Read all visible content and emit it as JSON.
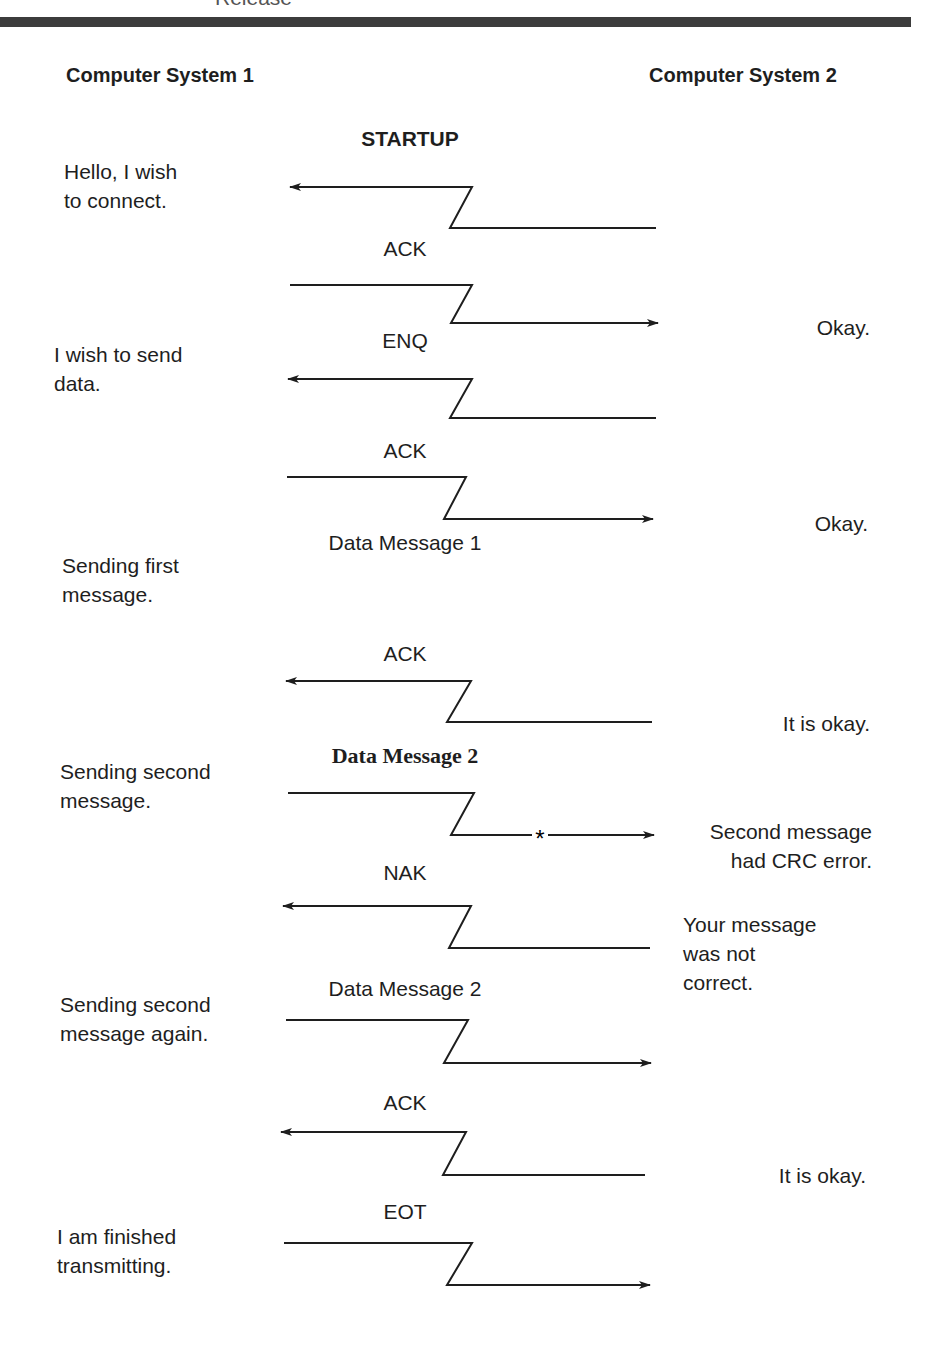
{
  "header": {
    "cut_title": "Release",
    "bar_color": "#3c3c3c",
    "left_column": "Computer System 1",
    "right_column": "Computer System 2"
  },
  "section_title": "STARTUP",
  "left_notes": [
    {
      "text": "Hello, I wish\nto connect.",
      "x": 64,
      "y": 157
    },
    {
      "text": "I wish to send\ndata.",
      "x": 54,
      "y": 340
    },
    {
      "text": "Sending first\nmessage.",
      "x": 62,
      "y": 551
    },
    {
      "text": "Sending second\nmessage.",
      "x": 60,
      "y": 757
    },
    {
      "text": "Sending second\nmessage again.",
      "x": 60,
      "y": 990
    },
    {
      "text": "I am finished\ntransmitting.",
      "x": 57,
      "y": 1222
    }
  ],
  "right_notes": [
    {
      "text": "Okay.",
      "right": 58,
      "y": 313
    },
    {
      "text": "Okay.",
      "right": 60,
      "y": 509
    },
    {
      "text": "It is okay.",
      "right": 58,
      "y": 709
    },
    {
      "text": "Second message\n  had CRC error.",
      "right": 56,
      "y": 817
    },
    {
      "text": "Your message\nwas not\ncorrect.",
      "left": 683,
      "y": 910
    },
    {
      "text": "It is okay.",
      "right": 62,
      "y": 1161
    }
  ],
  "messages": [
    {
      "label": "ACK",
      "label_y": 237,
      "direction": "to-system-1",
      "top": {
        "x1": 290,
        "x2": 472,
        "y": 187
      },
      "bottom": {
        "x1": 450,
        "x2": 656,
        "y": 228
      },
      "error": false
    },
    {
      "label": "ENQ",
      "label_y": 329,
      "direction": "to-system-2",
      "top": {
        "x1": 290,
        "x2": 472,
        "y": 285
      },
      "bottom": {
        "x1": 451,
        "x2": 658,
        "y": 323
      },
      "error": false
    },
    {
      "label": "ACK",
      "label_y": 439,
      "direction": "to-system-1",
      "top": {
        "x1": 287,
        "x2": 466,
        "y": 477
      },
      "bottom": {
        "x1": 444,
        "x2": 653,
        "y": 519
      },
      "error": false
    },
    {
      "label": "Data Message 1",
      "label_y": 531,
      "direction": "to-system-2",
      "top": {
        "x1": 288,
        "x2": 472,
        "y": 379
      },
      "bottom": {
        "x1": 450,
        "x2": 656,
        "y": 418
      },
      "error": false
    },
    {
      "label": "ACK",
      "label_y": 642,
      "direction": "to-system-1",
      "top": {
        "x1": 286,
        "x2": 471,
        "y": 681
      },
      "bottom": {
        "x1": 447,
        "x2": 652,
        "y": 722
      },
      "error": false
    },
    {
      "label": "Data Message 2",
      "label_y": 743,
      "direction": "to-system-2",
      "style": "serif",
      "top": {
        "x1": 288,
        "x2": 474,
        "y": 793
      },
      "bottom": {
        "x1": 451,
        "x2": 654,
        "y": 835
      },
      "error": true,
      "error_x": 540
    },
    {
      "label": "NAK",
      "label_y": 861,
      "direction": "to-system-1",
      "top": {
        "x1": 283,
        "x2": 471,
        "y": 906
      },
      "bottom": {
        "x1": 449,
        "x2": 650,
        "y": 948
      },
      "error": false
    },
    {
      "label": "Data Message 2",
      "label_y": 977,
      "direction": "to-system-2",
      "top": {
        "x1": 286,
        "x2": 468,
        "y": 1020
      },
      "bottom": {
        "x1": 444,
        "x2": 651,
        "y": 1063
      },
      "error": false
    },
    {
      "label": "ACK",
      "label_y": 1091,
      "direction": "to-system-1",
      "top": {
        "x1": 281,
        "x2": 466,
        "y": 1132
      },
      "bottom": {
        "x1": 443,
        "x2": 645,
        "y": 1175
      },
      "error": false
    },
    {
      "label": "EOT",
      "label_y": 1200,
      "direction": "to-system-2",
      "top": {
        "x1": 284,
        "x2": 472,
        "y": 1243
      },
      "bottom": {
        "x1": 447,
        "x2": 650,
        "y": 1285
      },
      "error": false
    }
  ],
  "error_marker": "*"
}
